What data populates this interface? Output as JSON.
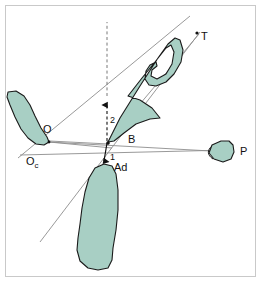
{
  "figure": {
    "background_color": "#ffffff",
    "frame_color": "#c9c9c9",
    "structure_fill": "#a8cfc4",
    "structure_stroke": "#1a1a1a",
    "line_color": "#9a9a9a",
    "construction_line_color": "#6f6f6f",
    "label_color": "#111111"
  },
  "labels": [
    {
      "id": "T",
      "text": "T",
      "x": 199,
      "y": 37,
      "kind": "point-label"
    },
    {
      "id": "O",
      "text": "O",
      "x": 46,
      "y": 131,
      "kind": "point-label"
    },
    {
      "id": "Oc",
      "text": "O",
      "sub": "c",
      "x": 29,
      "y": 162,
      "kind": "point-label"
    },
    {
      "id": "B",
      "text": "B",
      "x": 130,
      "y": 140,
      "kind": "point-label"
    },
    {
      "id": "P",
      "text": "P",
      "x": 239,
      "y": 152,
      "kind": "point-label"
    },
    {
      "id": "Ad",
      "text": "Ad",
      "x": 117,
      "y": 169,
      "kind": "point-label"
    },
    {
      "id": "v2",
      "text": "2",
      "x": 110,
      "y": 120,
      "kind": "vector-label"
    },
    {
      "id": "v1",
      "text": "1",
      "x": 111,
      "y": 158,
      "kind": "vector-label"
    }
  ],
  "structures": [
    {
      "id": "tongue-upper",
      "name": "upper-curved-structure-T",
      "label_ref": "T"
    },
    {
      "id": "left-structure",
      "name": "left-curved-structure-O",
      "label_ref": "O"
    },
    {
      "id": "lower-structure",
      "name": "lower-vertical-structure",
      "label_ref": "Ad"
    },
    {
      "id": "right-structure",
      "name": "right-leaf-structure-P",
      "label_ref": "P"
    }
  ],
  "vectors": [
    {
      "id": "vector-2",
      "label": "2",
      "direction": "up",
      "style": "dashed",
      "from": [
        108,
        141
      ],
      "to": [
        108,
        99
      ]
    },
    {
      "id": "vector-1",
      "label": "1",
      "direction": "down",
      "style": "solid",
      "from": [
        107,
        143
      ],
      "to": [
        104,
        163
      ]
    }
  ],
  "axes": [
    {
      "id": "axis-O-to-B",
      "from_label": "O",
      "to_label": "B"
    },
    {
      "id": "axis-Oc-to-P",
      "from_label": "Oc",
      "to_label": "P"
    },
    {
      "id": "axis-B-to-T",
      "from_label": "B",
      "to_label": "T"
    },
    {
      "id": "axis-lower-left-to-T",
      "from_label": "",
      "to_label": "T"
    }
  ]
}
